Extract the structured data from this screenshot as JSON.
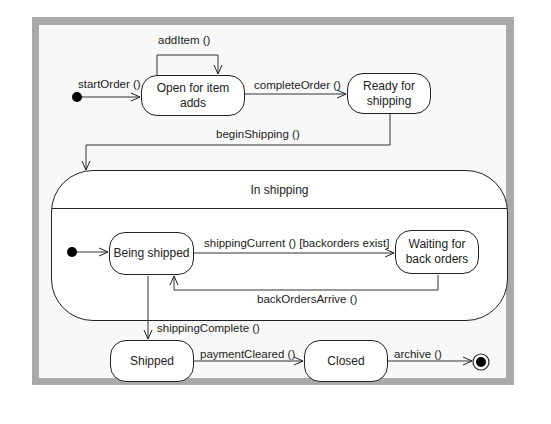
{
  "diagram": {
    "type": "UML state machine",
    "colors": {
      "frame": "#a9a9a9",
      "canvas": "#f8f8f8",
      "line": "#222222",
      "state_fill": "#ffffff"
    },
    "states": {
      "open": "Open for item adds",
      "ready_line1": "Ready for",
      "ready_line2": "shipping",
      "in_shipping": "In shipping",
      "being_shipped": "Being shipped",
      "waiting_line1": "Waiting for",
      "waiting_line2": "back orders",
      "shipped": "Shipped",
      "closed": "Closed"
    },
    "transitions": {
      "start_order": "startOrder ()",
      "add_item": "addItem ()",
      "complete_order": "completeOrder ()",
      "begin_shipping": "beginShipping ()",
      "shipping_current": "shippingCurrent () [backorders exist]",
      "back_orders_arrive": "backOrdersArrive ()",
      "shipping_complete": "shippingComplete ()",
      "payment_cleared": "paymentCleared ()",
      "archive": "archive ()"
    }
  }
}
